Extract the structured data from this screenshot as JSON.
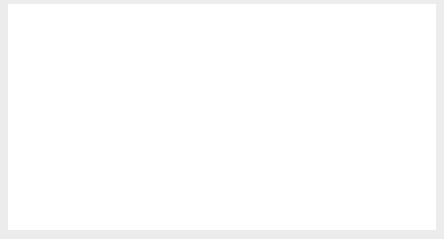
{
  "chart_data": {
    "type": "line",
    "title": "",
    "xlabel": "",
    "ylabel": "Percent",
    "ylim": [
      0,
      9
    ],
    "yticks": [
      0,
      1,
      2,
      3,
      4,
      5,
      6,
      7,
      8,
      9
    ],
    "ytick_labels": [
      "0",
      "1",
      "2",
      "3",
      "4",
      "5",
      "6",
      "7",
      "8",
      "9"
    ],
    "xlim": [
      1999.0,
      2004.0
    ],
    "xticks": [
      2000,
      2001,
      2002,
      2003,
      2004
    ],
    "xtick_labels": [
      "2000",
      "2001",
      "2002",
      "2003"
    ],
    "xtick_label_positions": [
      1999.5,
      2000.5,
      2001.5,
      2002.5
    ],
    "grid": "horizontal",
    "plot_background": "#d2d2d2",
    "gridline_color": "#f0f0f0",
    "legend_position": "inline-annotations",
    "series": [
      {
        "name": "30-year fixed-rate mortgage",
        "color": "#7a7a7a",
        "width": 2.0,
        "x": [
          1999.0,
          1999.08,
          1999.17,
          1999.25,
          1999.33,
          1999.42,
          1999.5,
          1999.58,
          1999.67,
          1999.75,
          1999.83,
          1999.92,
          2000.0,
          2000.08,
          2000.17,
          2000.25,
          2000.33,
          2000.42,
          2000.5,
          2000.58,
          2000.67,
          2000.75,
          2000.83,
          2000.92,
          2001.0,
          2001.08,
          2001.17,
          2001.25,
          2001.33,
          2001.42,
          2001.5,
          2001.58,
          2001.67,
          2001.75,
          2001.83,
          2001.92,
          2002.0,
          2002.08,
          2002.17,
          2002.25,
          2002.33,
          2002.42,
          2002.5,
          2002.58,
          2002.67,
          2002.75,
          2002.83,
          2002.92,
          2003.0,
          2003.08,
          2003.17,
          2003.25,
          2003.33,
          2003.42,
          2003.5,
          2003.58,
          2003.67,
          2003.75,
          2003.83,
          2003.92
        ],
        "values": [
          8.2,
          8.22,
          8.3,
          8.35,
          8.28,
          8.55,
          8.32,
          8.25,
          8.2,
          8.15,
          8.05,
          7.95,
          7.9,
          7.85,
          7.8,
          7.75,
          7.3,
          7.1,
          7.05,
          7.0,
          7.05,
          7.1,
          7.1,
          7.05,
          7.0,
          6.95,
          6.9,
          7.0,
          7.1,
          7.12,
          7.05,
          6.95,
          6.85,
          6.8,
          6.75,
          6.7,
          6.65,
          6.62,
          6.6,
          6.6,
          6.55,
          6.52,
          6.48,
          6.3,
          6.15,
          6.05,
          6.2,
          6.05,
          5.9,
          5.8,
          5.7,
          5.25,
          5.4,
          5.9,
          6.25,
          6.2,
          6.1,
          6.05,
          5.6,
          6.3
        ]
      },
      {
        "name": "10-year treasury note",
        "color": "#141414",
        "width": 2.4,
        "x": [
          1999.0,
          1999.08,
          1999.17,
          1999.25,
          1999.33,
          1999.42,
          1999.5,
          1999.58,
          1999.67,
          1999.75,
          1999.83,
          1999.92,
          2000.0,
          2000.08,
          2000.17,
          2000.25,
          2000.33,
          2000.42,
          2000.5,
          2000.58,
          2000.67,
          2000.75,
          2000.83,
          2000.92,
          2001.0,
          2001.08,
          2001.17,
          2001.25,
          2001.33,
          2001.42,
          2001.5,
          2001.58,
          2001.67,
          2001.75,
          2001.83,
          2001.92,
          2002.0,
          2002.08,
          2002.17,
          2002.25,
          2002.33,
          2002.42,
          2002.5,
          2002.58,
          2002.67,
          2002.75,
          2002.83,
          2002.92,
          2003.0,
          2003.08,
          2003.17,
          2003.25,
          2003.33,
          2003.42,
          2003.5,
          2003.58,
          2003.67,
          2003.75,
          2003.83,
          2003.92
        ],
        "values": [
          6.65,
          6.55,
          6.4,
          6.25,
          6.1,
          6.45,
          6.2,
          6.15,
          6.05,
          6.0,
          5.9,
          5.85,
          5.8,
          5.6,
          5.55,
          5.5,
          5.2,
          5.15,
          5.1,
          5.05,
          5.0,
          4.92,
          5.1,
          5.35,
          5.3,
          5.25,
          5.15,
          5.3,
          5.2,
          5.1,
          5.05,
          4.85,
          4.65,
          4.6,
          4.75,
          5.1,
          5.15,
          5.05,
          5.0,
          4.9,
          4.6,
          4.5,
          4.45,
          4.45,
          4.4,
          4.45,
          4.25,
          4.15,
          4.3,
          4.1,
          3.85,
          3.4,
          3.95,
          4.35,
          4.2,
          4.25,
          4.25,
          4.2,
          3.95,
          4.6
        ]
      },
      {
        "name": "Federal funds rate",
        "color": "#8c8c8c",
        "width": 2.4,
        "x": [
          1999.0,
          1999.08,
          1999.17,
          1999.25,
          1999.33,
          1999.42,
          1999.5,
          1999.58,
          1999.67,
          1999.75,
          1999.83,
          1999.92,
          2000.0,
          2000.08,
          2000.17,
          2000.25,
          2000.33,
          2000.42,
          2000.5,
          2000.58,
          2000.67,
          2000.75,
          2000.83,
          2000.92,
          2001.0,
          2001.08,
          2001.17,
          2001.25,
          2001.33,
          2001.42,
          2001.5,
          2001.58,
          2001.67,
          2001.75,
          2001.83,
          2001.92,
          2002.0,
          2002.17,
          2002.42,
          2002.58,
          2002.67,
          2002.83,
          2002.92,
          2003.0,
          2003.17,
          2003.33,
          2003.42,
          2003.5,
          2003.67,
          2003.83,
          2003.92
        ],
        "values": [
          5.5,
          5.65,
          5.8,
          5.95,
          6.05,
          6.2,
          6.3,
          6.4,
          6.45,
          6.48,
          6.5,
          6.5,
          6.5,
          6.5,
          6.5,
          6.5,
          6.5,
          6.5,
          6.5,
          6.5,
          6.5,
          6.5,
          6.4,
          6.0,
          5.5,
          5.0,
          4.6,
          4.35,
          4.3,
          3.9,
          3.6,
          3.2,
          2.6,
          2.1,
          1.82,
          1.75,
          1.75,
          1.75,
          1.75,
          1.75,
          1.75,
          1.75,
          1.75,
          1.25,
          1.25,
          1.25,
          1.25,
          1.2,
          1.0,
          1.0,
          1.0
        ]
      }
    ],
    "annotations": [
      {
        "name": "mortgage-annotation",
        "text": "30-year fixed-rate mortgage",
        "text_x": 245,
        "text_y": 51,
        "leader": [
          243,
          56,
          235,
          76
        ]
      },
      {
        "name": "treasury-annotation",
        "text": "10-year treasury note",
        "text_x": 303,
        "text_y": 155,
        "leader": [
          345,
          147,
          357,
          126
        ]
      },
      {
        "name": "fedfunds-annotation",
        "text": "Federal funds rate",
        "text_x": 62,
        "text_y": 176,
        "leader": [
          161,
          172,
          180,
          161
        ]
      }
    ]
  }
}
